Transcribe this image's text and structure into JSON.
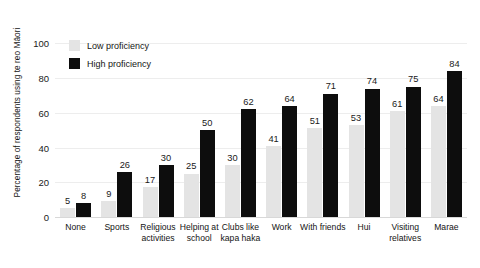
{
  "chart_data": {
    "type": "bar",
    "title": "",
    "xlabel": "",
    "ylabel": "Percentage of respondents using te reo Māori",
    "ylim": [
      0,
      110
    ],
    "yticks": [
      0,
      20,
      40,
      60,
      80,
      100
    ],
    "grid": true,
    "legend_position": "top-left",
    "categories": [
      "None",
      "Sports",
      "Religious activities",
      "Helping at school",
      "Clubs like kapa haka",
      "Work",
      "With friends",
      "Hui",
      "Visiting relatives",
      "Marae"
    ],
    "series": [
      {
        "name": "Low proficiency",
        "color": "#e4e4e4",
        "values": [
          5,
          9,
          17,
          25,
          30,
          41,
          51,
          53,
          61,
          64
        ]
      },
      {
        "name": "High proficiency",
        "color": "#0d0d0d",
        "values": [
          8,
          26,
          30,
          50,
          62,
          64,
          71,
          74,
          75,
          84
        ]
      }
    ]
  },
  "legend": {
    "items": [
      {
        "label": "Low proficiency",
        "color": "#e4e4e4"
      },
      {
        "label": "High proficiency",
        "color": "#0d0d0d"
      }
    ]
  }
}
